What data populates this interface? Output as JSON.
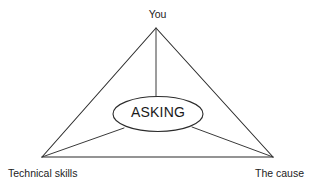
{
  "diagram": {
    "type": "triangle-with-center-node",
    "title": "",
    "background_color": "#ffffff",
    "line_color": "#2b2b2b",
    "center_node": {
      "label": "ASKING",
      "shape": "ellipse",
      "fill_color": "#ffffff"
    },
    "vertices": [
      {
        "id": "top",
        "label": "You",
        "position": "top-center"
      },
      {
        "id": "bottom-left",
        "label": "Technical skills",
        "position": "bottom-left"
      },
      {
        "id": "bottom-right",
        "label": "The cause",
        "position": "bottom-right"
      }
    ],
    "connections": [
      {
        "from": "top",
        "to": "bottom-left",
        "style": "solid"
      },
      {
        "from": "top",
        "to": "bottom-right",
        "style": "solid"
      },
      {
        "from": "bottom-left",
        "to": "bottom-right",
        "style": "solid"
      },
      {
        "from": "top",
        "to": "center_node",
        "style": "solid"
      },
      {
        "from": "bottom-left",
        "to": "center_node",
        "style": "solid"
      },
      {
        "from": "bottom-right",
        "to": "center_node",
        "style": "solid"
      }
    ]
  }
}
